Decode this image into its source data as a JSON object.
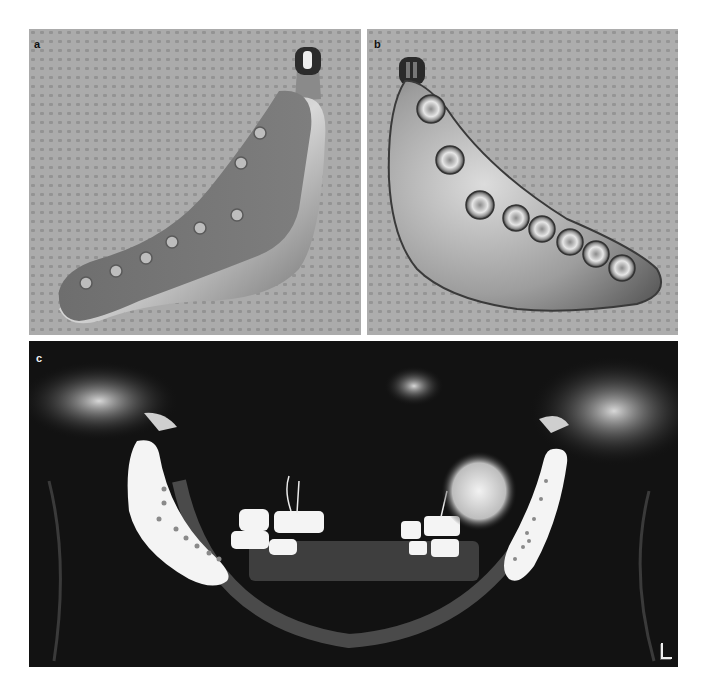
{
  "figure": {
    "panels": [
      {
        "id": "a",
        "label": "a",
        "subject": "custom mandibular implant, bone-contact side",
        "screw_holes": 8
      },
      {
        "id": "b",
        "label": "b",
        "subject": "custom mandibular implant, outer side with countersunk screw holes",
        "screw_holes": 8
      },
      {
        "id": "c",
        "label": "c",
        "subject": "panoramic radiograph with bilateral mandibular implants",
        "side_marker": "L"
      }
    ],
    "colors": {
      "background": "#ffffff",
      "drape": "#a8a8a8",
      "metal": "#9a9a9a",
      "xray_bg": "#121212",
      "xray_bright": "#f4f4f4"
    }
  }
}
